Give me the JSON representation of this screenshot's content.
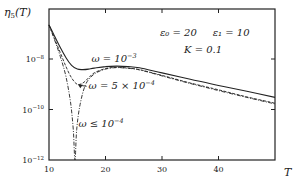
{
  "chart_data": {
    "type": "line",
    "title": "",
    "xlabel": "T",
    "ylabel": "η_5(T)",
    "ylabel_main": "η",
    "ylabel_sub": "5",
    "ylabel_arg": "(T)",
    "xlim": [
      10,
      50
    ],
    "ylim_log10": [
      -12,
      -6.4
    ],
    "yscale": "log",
    "x_ticks": [
      10,
      20,
      30,
      40
    ],
    "x_tick_labels": [
      "10",
      "20",
      "30",
      "40"
    ],
    "y_ticks_log10": [
      -8,
      -10,
      -12
    ],
    "y_tick_labels": [
      {
        "base": "10",
        "exp": "−8"
      },
      {
        "base": "10",
        "exp": "−10"
      },
      {
        "base": "10",
        "exp": "−12"
      }
    ],
    "grid": false,
    "parameters": {
      "line1": "ε₀ = 20     ε₁ = 10",
      "line2": "K = 0.1"
    },
    "series": [
      {
        "name": "ω = 10⁻³",
        "style": "solid",
        "x": [
          10,
          11,
          12,
          13,
          14,
          15,
          16,
          17,
          18,
          20,
          22,
          24,
          26,
          30,
          35,
          40,
          45,
          50
        ],
        "log10_y": [
          -6.65,
          -7.1,
          -7.55,
          -7.95,
          -8.25,
          -8.4,
          -8.42,
          -8.4,
          -8.36,
          -8.3,
          -8.28,
          -8.3,
          -8.35,
          -8.55,
          -8.8,
          -9.05,
          -9.28,
          -9.52
        ]
      },
      {
        "name": "ω = 5 × 10⁻⁴",
        "style": "dashed",
        "x": [
          10,
          11,
          12,
          13,
          14,
          15,
          16,
          17,
          18,
          20,
          22,
          24,
          26,
          30,
          35,
          40,
          45,
          50
        ],
        "log10_y": [
          -6.65,
          -7.2,
          -7.75,
          -8.3,
          -8.75,
          -9.0,
          -8.95,
          -8.75,
          -8.55,
          -8.38,
          -8.33,
          -8.36,
          -8.42,
          -8.65,
          -8.95,
          -9.22,
          -9.5,
          -9.75
        ]
      },
      {
        "name": "ω ≤ 10⁻⁴",
        "style": "dash-dot",
        "x": [
          10,
          11,
          12,
          13,
          13.8,
          14.3,
          14.6,
          14.9,
          15.5,
          16.5,
          18,
          20,
          22,
          24,
          26,
          30,
          35,
          40,
          45,
          50
        ],
        "log10_y": [
          -6.65,
          -7.25,
          -7.9,
          -8.7,
          -9.7,
          -10.8,
          -12.0,
          -10.8,
          -9.8,
          -9.0,
          -8.6,
          -8.4,
          -8.34,
          -8.37,
          -8.43,
          -8.67,
          -8.97,
          -9.25,
          -9.52,
          -9.78
        ]
      }
    ],
    "annotations": [
      {
        "text": "ω = 10⁻³",
        "main": "ω = 10",
        "exp": "−3",
        "x": 17.5,
        "log10_y": -8.1
      },
      {
        "text": "ω = 5 × 10⁻⁴",
        "main": "ω = 5 × 10",
        "exp": "−4",
        "x": 17.0,
        "log10_y": -9.2,
        "arrow_to": {
          "x": 15.1,
          "log10_y": -9.0
        }
      },
      {
        "text": "ω ≤ 10⁻⁴",
        "main": "ω ≤ 10",
        "exp": "−4",
        "x": 15.2,
        "log10_y": -10.7
      }
    ]
  }
}
